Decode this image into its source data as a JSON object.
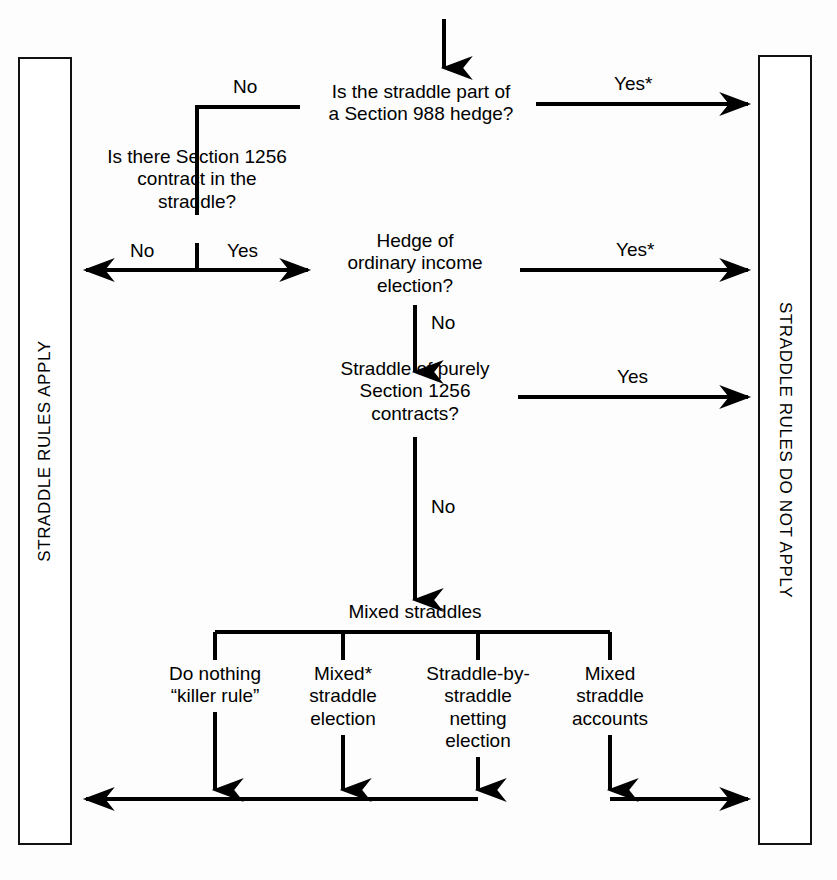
{
  "figure": {
    "type": "flowchart",
    "orientation": "top-to-bottom",
    "left_outcome": "STRADDLE RULES APPLY",
    "right_outcome": "STRADDLE RULES DO NOT APPLY"
  },
  "nodes": {
    "q1": "Is the straddle part of\na Section 988 hedge?",
    "q2": "Is there Section 1256\ncontract in the\nstraddle?",
    "q3": "Hedge of\nordinary income\nelection?",
    "q4": "Straddle of purely\nSection 1256\ncontracts?",
    "mixed": "Mixed straddles"
  },
  "leaves": [
    {
      "label": "Do nothing\n“killer rule”",
      "outcome": "left"
    },
    {
      "label": "Mixed*\nstraddle\nelection",
      "outcome": "left"
    },
    {
      "label": "Straddle-by-\nstraddle\nnetting\nelection",
      "outcome": "left"
    },
    {
      "label": "Mixed\nstraddle\naccounts",
      "outcome": "right"
    }
  ],
  "edge_labels": {
    "q1_no": "No",
    "q1_yes": "Yes*",
    "q2_no": "No",
    "q2_yes": "Yes",
    "q3_yes": "Yes*",
    "q3_no": "No",
    "q4_yes": "Yes",
    "q4_no": "No"
  },
  "colors": {
    "ink": "#000000",
    "background": "#fdfdfd",
    "panel_border": "#111111"
  }
}
